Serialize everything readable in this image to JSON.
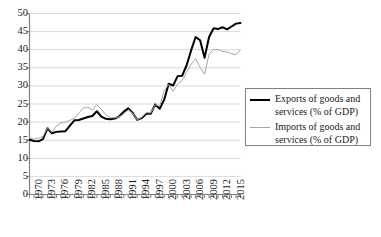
{
  "chart_data": {
    "type": "line",
    "title": "",
    "subtitle": "",
    "xlabel": "",
    "ylabel": "",
    "grid": "horizontal",
    "legend_position": "right",
    "xlim": [
      1970,
      2017
    ],
    "ylim": [
      0,
      50
    ],
    "ytick_step": 5,
    "xtick_step": 3,
    "ytick_labels": [
      "0",
      "5",
      "10",
      "15",
      "20",
      "25",
      "30",
      "35",
      "40",
      "45",
      "50"
    ],
    "ytick_values": [
      0,
      5,
      10,
      15,
      20,
      25,
      30,
      35,
      40,
      45,
      50
    ],
    "xtick_labels": [
      "1970",
      "1973",
      "1976",
      "1979",
      "1982",
      "1985",
      "1988",
      "1991",
      "1994",
      "1997",
      "2000",
      "2003",
      "2006",
      "2009",
      "2012",
      "2015"
    ],
    "xtick_values": [
      1970,
      1973,
      1976,
      1979,
      1982,
      1985,
      1988,
      1991,
      1994,
      1997,
      2000,
      2003,
      2006,
      2009,
      2012,
      2015
    ],
    "x": [
      1970,
      1971,
      1972,
      1973,
      1974,
      1975,
      1976,
      1977,
      1978,
      1979,
      1980,
      1981,
      1982,
      1983,
      1984,
      1985,
      1986,
      1987,
      1988,
      1989,
      1990,
      1991,
      1992,
      1993,
      1994,
      1995,
      1996,
      1997,
      1998,
      1999,
      2000,
      2001,
      2002,
      2003,
      2004,
      2005,
      2006,
      2007,
      2008,
      2009,
      2010,
      2011,
      2012,
      2013,
      2014,
      2015,
      2016,
      2017
    ],
    "series": [
      {
        "name": "Exports of goods and services (% of GDP)",
        "color": "#000000",
        "line_width": 2,
        "values": [
          15.1,
          14.8,
          14.7,
          15.3,
          18.3,
          16.9,
          17.3,
          17.4,
          17.5,
          19.0,
          20.5,
          20.6,
          21.0,
          21.4,
          21.7,
          23.0,
          21.5,
          20.9,
          20.8,
          21.0,
          21.6,
          22.9,
          23.8,
          22.5,
          20.6,
          21.1,
          22.3,
          22.3,
          24.9,
          23.7,
          26.2,
          30.6,
          30.1,
          32.7,
          32.8,
          35.7,
          39.8,
          43.5,
          42.6,
          37.8,
          43.5,
          45.9,
          45.7,
          46.2,
          45.6,
          46.4,
          47.2,
          47.4
        ]
      },
      {
        "name": "Imports of goods and services (% of GDP)",
        "color": "#a6a6a6",
        "line_width": 1,
        "values": [
          15.6,
          15.3,
          15.6,
          16.0,
          18.4,
          17.2,
          18.9,
          19.8,
          20.0,
          20.5,
          21.0,
          22.5,
          23.9,
          24.1,
          23.3,
          24.8,
          23.6,
          22.0,
          21.2,
          21.2,
          21.5,
          22.2,
          23.4,
          22.4,
          20.6,
          21.3,
          22.6,
          22.5,
          24.8,
          24.4,
          28.7,
          30.4,
          28.5,
          30.5,
          31.5,
          33.8,
          36.0,
          37.5,
          35.1,
          33.2,
          38.8,
          40.1,
          40.0,
          39.5,
          39.4,
          38.9,
          38.6,
          40.0
        ]
      }
    ]
  },
  "legend": {
    "items": [
      {
        "label": "Exports of goods and services (% of GDP)",
        "swatch": "exports"
      },
      {
        "label": "Imports of goods and services (% of GDP)",
        "swatch": "imports"
      }
    ]
  },
  "colors": {
    "exports_line": "#000000",
    "imports_line": "#a6a6a6",
    "gridline": "#d9d9d9",
    "axis": "#808080",
    "text": "#1a1a1a",
    "background": "#ffffff"
  }
}
